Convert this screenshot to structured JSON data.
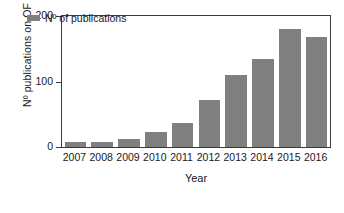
{
  "chart_data": {
    "type": "bar",
    "title": "",
    "xlabel": "Year",
    "ylabel": "Nº publications on OF",
    "categories": [
      "2007",
      "2008",
      "2009",
      "2010",
      "2011",
      "2012",
      "2013",
      "2014",
      "2015",
      "2016"
    ],
    "values": [
      8,
      8,
      12,
      23,
      37,
      72,
      110,
      135,
      180,
      168
    ],
    "series": [
      {
        "name": "Nº of publications",
        "values": [
          8,
          8,
          12,
          23,
          37,
          72,
          110,
          135,
          180,
          168
        ]
      }
    ],
    "ylim": [
      0,
      200
    ],
    "yticks": [
      0,
      100,
      200
    ],
    "ytick_labels": [
      "0",
      "100",
      "200"
    ],
    "grid": false,
    "legend_position": "top-left",
    "bar_color": "#808080",
    "axis_color": "#3a3a3a"
  },
  "legend": {
    "label": "Nº of publications"
  },
  "axes": {
    "y_title": "Nº publications on OF",
    "x_title": "Year"
  }
}
